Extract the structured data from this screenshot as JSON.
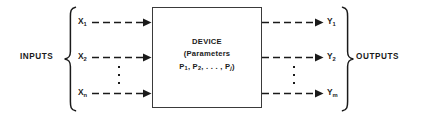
{
  "diagram": {
    "line_color": "#1a1a1a",
    "box_border_color": "#3a3a3a",
    "background": "#ffffff"
  },
  "left_group": {
    "label": "INPUTS",
    "brace": "left-curly-brace",
    "signals": [
      {
        "name": "X",
        "sub": "1",
        "full": "X1"
      },
      {
        "name": "X",
        "sub": "2",
        "full": "X2"
      },
      {
        "name": "X",
        "sub": "n",
        "full": "Xn"
      }
    ],
    "ellipsis": "vertical-ellipsis"
  },
  "right_group": {
    "label": "OUTPUTS",
    "brace": "right-curly-brace",
    "signals": [
      {
        "name": "Y",
        "sub": "1",
        "full": "Y1"
      },
      {
        "name": "Y",
        "sub": "2",
        "full": "Y2"
      },
      {
        "name": "Y",
        "sub": "m",
        "full": "Ym"
      }
    ],
    "ellipsis": "vertical-ellipsis"
  },
  "device": {
    "title": "DEVICE",
    "subtitle": "(Parameters",
    "parameters_prefix": "P",
    "parameters": [
      {
        "name": "P",
        "sub": "1"
      },
      {
        "name": "P",
        "sub": "2"
      }
    ],
    "parameters_ellipsis": ". . .",
    "parameters_last": {
      "name": "P",
      "sub": "j"
    },
    "parameters_line_text": "P1, P2, . . . , Pj)"
  },
  "arrows": {
    "style": "dashed-with-solid-arrowhead",
    "count_left": 3,
    "count_right": 3
  }
}
